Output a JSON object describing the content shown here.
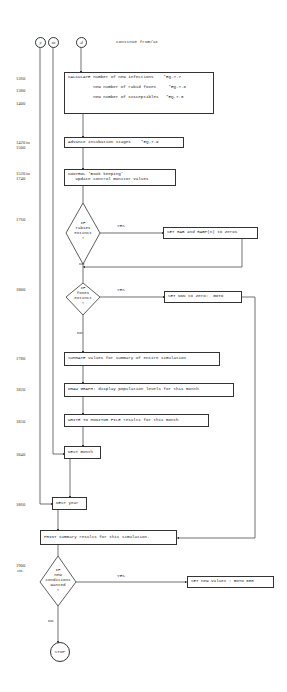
{
  "header": {
    "connectors": [
      {
        "id": "y",
        "label": "y"
      },
      {
        "id": "m",
        "label": "m"
      },
      {
        "id": "d",
        "label": "d"
      }
    ],
    "continues_label": "continue from/at"
  },
  "line_numbers": {
    "l1360": "1360",
    "l1380": "1380",
    "l1400": "1400",
    "l1420": "1420 to\n1500",
    "l1520": "1520 to\n1740",
    "l1760": "1760",
    "l1800": "1800",
    "l1780": "1780",
    "l1820": "1820",
    "l1850": "1850",
    "l1840": "1840",
    "l1860": "1860",
    "l1900": "1900\n etc."
  },
  "boxes": {
    "calculate": "CALCULATE number of new infections    *EQ.7.7\n\n          new number of rabid foxes     *EQ.7.6\n\n          new number of susceptibles   *EQ.7.8",
    "advance": "Advance incubation stages    *EQ.7.9",
    "control": "CONTROL 'Book keeping'\n   Update control monitor values",
    "set_rab": "SET RAB and RABP(n) to Zeros",
    "set_non": "SET NON to Zero:  GOTO",
    "summate": "SUMMATE values for summary of entire simulation",
    "draw_graph": "DRAW GRAPH: display population levels for this month",
    "write_monitor": "WRITE TO MONITOR FILE results for this month",
    "next_month": "NEXT month",
    "next_year": "NEXT year",
    "print_summary": "PRINT summary results for this simulation.",
    "set_new_values": "SET new values : GOTO 880"
  },
  "decisions": {
    "rabies": "IF\nrabies\nextinct\n?",
    "foxes": "IF\nfoxes\nextinct\n?",
    "new_conditions": "IF\nnew\nconditions\nwanted\n?"
  },
  "branch_labels": {
    "yes": "YES",
    "no": "NO"
  },
  "terminal": {
    "stop": "STOP"
  },
  "colors": {
    "line": "#333333",
    "background": "#ffffff"
  }
}
